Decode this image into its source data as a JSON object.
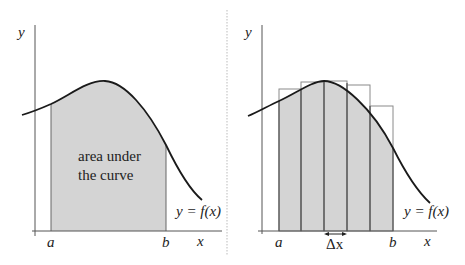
{
  "colors": {
    "shade": "#d4d4d4",
    "curve": "#1a1a1a",
    "axis": "#555555",
    "rect_edge": "#555555",
    "rect_outline": "#8a8a8a",
    "divider": "#bbbbbb"
  },
  "left_panel": {
    "y_label": "y",
    "x_label": "x",
    "a_label": "a",
    "b_label": "b",
    "function_label": "y = f(x)",
    "area_text_line1": "area under",
    "area_text_line2": "the curve"
  },
  "right_panel": {
    "y_label": "y",
    "x_label": "x",
    "a_label": "a",
    "b_label": "b",
    "delta_label": "Δx",
    "function_label": "y = f(x)",
    "rectangle_count": 5
  }
}
